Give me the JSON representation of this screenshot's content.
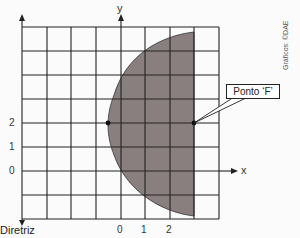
{
  "diagram": {
    "y_axis_label": "y",
    "x_axis_label": "x",
    "y_ticks": [
      "2",
      "1",
      "0"
    ],
    "x_ticks": [
      "0",
      "1",
      "2"
    ],
    "directrix_label": "Diretriz",
    "focus_label": "Ponto ‘F’",
    "credit": "Gráficos: ©DAE",
    "colors": {
      "shading": "#8a7f7f",
      "grid": "#222222"
    }
  }
}
